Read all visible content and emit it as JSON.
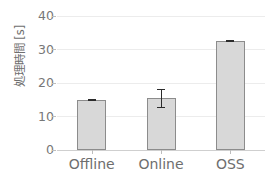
{
  "chart_data": {
    "type": "bar",
    "title": "",
    "xlabel": "",
    "ylabel": "処理時間 [s]",
    "categories": [
      "Offline",
      "Online",
      "OSS"
    ],
    "values": [
      15.0,
      15.4,
      32.6
    ],
    "errors": [
      0.2,
      2.9,
      0.3
    ],
    "ylim": [
      0,
      40
    ],
    "yticks": [
      0,
      10,
      20,
      30,
      40
    ],
    "ytick_labels": [
      "0",
      "10",
      "20",
      "30",
      "40"
    ],
    "grid": "horizontal",
    "legend": "none",
    "series": [
      {
        "name": "処理時間",
        "values": [
          15.0,
          15.4,
          32.6
        ],
        "errors": [
          0.2,
          2.9,
          0.3
        ]
      }
    ]
  },
  "style": {
    "bar_fill": "#d8d8d8",
    "bar_edge": "#8c8c8c",
    "gridline_color": "#ececec",
    "axis_color": "#cfcfcf",
    "tick_text_color": "#6e6e6e",
    "errorbar_color": "#2b2b2b",
    "background": "#ffffff"
  }
}
